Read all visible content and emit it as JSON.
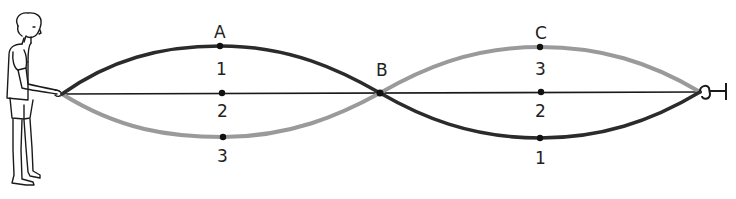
{
  "figure": {
    "colors": {
      "dark_wave": "#2b2b2b",
      "light_wave": "#9a9a9a",
      "rope_rest": "#1a1a1a",
      "ink": "#222222"
    },
    "labels": {
      "A": "A",
      "B": "B",
      "C": "C"
    },
    "position_labels_left": {
      "top": "1",
      "middle": "2",
      "bottom": "3"
    },
    "position_labels_right": {
      "top": "3",
      "middle": "2",
      "bottom": "1"
    },
    "icons": {
      "person": "person-holding-rope-icon",
      "hook": "wall-hook-icon"
    }
  }
}
